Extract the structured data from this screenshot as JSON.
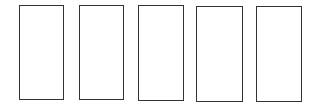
{
  "diagram": {
    "stroke_color": "#333333",
    "background": "#ffffff",
    "boxes": [
      {
        "x": 19,
        "y": 5,
        "w": 45,
        "h": 95
      },
      {
        "x": 79,
        "y": 5,
        "w": 45,
        "h": 95
      },
      {
        "x": 138,
        "y": 5,
        "w": 46,
        "h": 96
      },
      {
        "x": 196,
        "y": 6,
        "w": 47,
        "h": 96
      },
      {
        "x": 256,
        "y": 6,
        "w": 46,
        "h": 96
      }
    ]
  }
}
